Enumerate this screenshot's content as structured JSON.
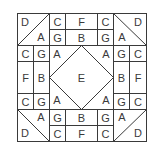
{
  "diagram": {
    "type": "quilt-block-pattern",
    "line_color": "#3a3a3a",
    "background": "#ffffff",
    "labels": {
      "top_left_D": "D",
      "top_left_A": "A",
      "top_C1": "C",
      "top_F": "F",
      "top_C2": "C",
      "top_G1": "G",
      "top_B": "B",
      "top_G2": "G",
      "top_right_D": "D",
      "top_right_A": "A",
      "left_C_top": "C",
      "left_G_top": "G",
      "left_F": "F",
      "left_B": "B",
      "left_C_bot": "C",
      "left_G_bot": "G",
      "center_A_tl": "A",
      "center_A_tr": "A",
      "center_A_bl": "A",
      "center_A_br": "A",
      "center_E": "E",
      "right_G_top": "G",
      "right_C_top": "C",
      "right_B": "B",
      "right_F": "F",
      "right_G_bot": "G",
      "right_C_bot": "C",
      "bot_left_A": "A",
      "bot_left_D": "D",
      "bot_G1": "G",
      "bot_B": "B",
      "bot_G2": "G",
      "bot_C1": "C",
      "bot_F": "F",
      "bot_C2": "C",
      "bot_right_A": "A",
      "bot_right_D": "D"
    }
  }
}
